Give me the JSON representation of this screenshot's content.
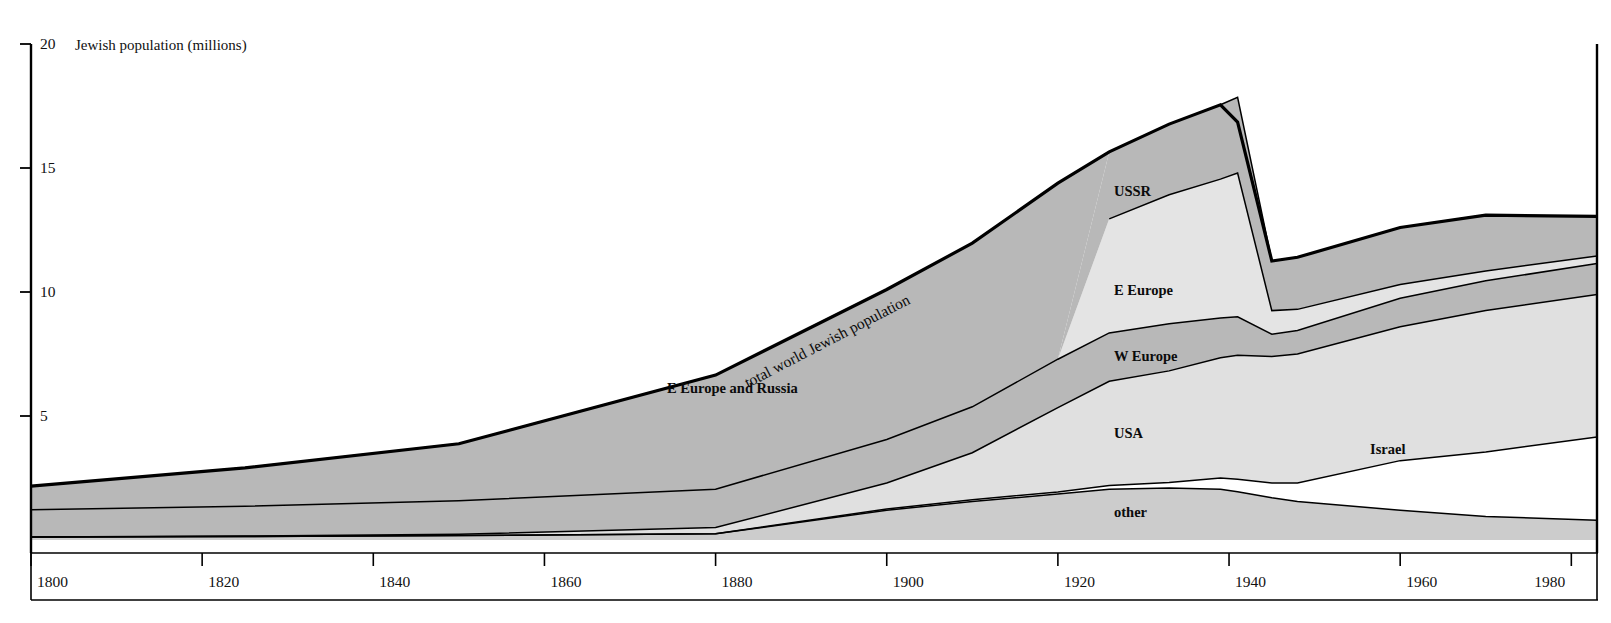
{
  "figure": {
    "y_axis_caption": "Jewish population  (millions)",
    "total_curve_label": "total world Jewish population"
  },
  "chart_data": {
    "type": "area",
    "title": "Jewish population  (millions)",
    "subtitle": "",
    "xlabel": "",
    "ylabel": "Jewish population  (millions)",
    "stacked": true,
    "grid": false,
    "legend_position": "inline-band-labels",
    "xlim": [
      1800,
      1983
    ],
    "ylim": [
      0,
      20
    ],
    "xticks": [
      1800,
      1820,
      1840,
      1860,
      1880,
      1900,
      1920,
      1940,
      1960,
      1980
    ],
    "xticklabels": [
      "1800",
      "1820",
      "1840",
      "1860",
      "1880",
      "1900",
      "1920",
      "1940",
      "1960",
      "1980"
    ],
    "yticks": [
      5,
      10,
      15,
      20
    ],
    "yticklabels": [
      "5",
      "10",
      "15",
      "20"
    ],
    "annotations": [
      {
        "text": "total world Jewish population",
        "kind": "curve-label",
        "target": "total"
      },
      {
        "text": "E Europe and Russia",
        "kind": "band-label",
        "target": "e-europe-and-russia"
      },
      {
        "text": "USSR",
        "kind": "band-label",
        "target": "ussr"
      },
      {
        "text": "E Europe",
        "kind": "band-label",
        "target": "e-europe"
      },
      {
        "text": "W Europe",
        "kind": "band-label",
        "target": "w-europe"
      },
      {
        "text": "USA",
        "kind": "band-label",
        "target": "usa"
      },
      {
        "text": "Israel",
        "kind": "band-label",
        "target": "israel"
      },
      {
        "text": "other",
        "kind": "band-label",
        "target": "other"
      }
    ],
    "x": [
      1800,
      1825,
      1850,
      1880,
      1900,
      1910,
      1920,
      1926,
      1933,
      1939,
      1941,
      1945,
      1948,
      1960,
      1970,
      1983
    ],
    "series": [
      {
        "name": "other",
        "color": "#cccccc",
        "values": [
          0.12,
          0.14,
          0.18,
          0.25,
          1.2,
          1.55,
          1.85,
          2.05,
          2.1,
          2.05,
          1.95,
          1.7,
          1.55,
          1.2,
          0.95,
          0.8
        ]
      },
      {
        "name": "Israel",
        "color": "#ffffff",
        "values": [
          0.0,
          0.0,
          0.0,
          0.0,
          0.05,
          0.07,
          0.09,
          0.15,
          0.22,
          0.45,
          0.5,
          0.6,
          0.75,
          2.0,
          2.6,
          3.35
        ]
      },
      {
        "name": "USA",
        "color": "#e0e0e0",
        "values": [
          0.0,
          0.02,
          0.05,
          0.25,
          1.05,
          1.9,
          3.4,
          4.2,
          4.5,
          4.85,
          5.0,
          5.1,
          5.2,
          5.4,
          5.7,
          5.75
        ]
      },
      {
        "name": "W Europe",
        "color": "#b8b8b8",
        "values": [
          1.1,
          1.2,
          1.35,
          1.55,
          1.75,
          1.85,
          1.95,
          1.95,
          1.9,
          1.6,
          1.55,
          0.9,
          0.95,
          1.15,
          1.2,
          1.25
        ]
      },
      {
        "name": "E Europe",
        "color": "#e4e4e4",
        "values": [
          0.0,
          0.0,
          0.0,
          0.0,
          0.0,
          0.0,
          0.0,
          4.6,
          5.2,
          5.6,
          5.8,
          0.95,
          0.85,
          0.55,
          0.4,
          0.3
        ]
      },
      {
        "name": "USSR",
        "color": "#b8b8b8",
        "values": [
          0.0,
          0.0,
          0.0,
          0.0,
          0.0,
          0.0,
          0.0,
          2.7,
          2.85,
          3.0,
          3.05,
          2.0,
          2.1,
          2.3,
          2.25,
          1.6
        ]
      },
      {
        "name": "E Europe and Russia",
        "color": "#b8b8b8",
        "values": [
          0.95,
          1.55,
          2.3,
          4.6,
          6.05,
          6.6,
          7.1,
          0.0,
          0.0,
          0.0,
          0.0,
          0.0,
          0.0,
          0.0,
          0.0,
          0.0
        ]
      }
    ],
    "total": {
      "name": "total world Jewish population",
      "values": [
        2.17,
        2.91,
        3.88,
        6.65,
        10.1,
        11.97,
        14.39,
        15.65,
        16.77,
        17.55,
        16.85,
        11.25,
        11.4,
        12.6,
        13.1,
        13.05
      ]
    }
  }
}
